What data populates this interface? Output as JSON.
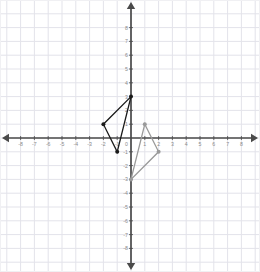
{
  "chart_data": {
    "type": "scatter",
    "title": "",
    "subtitle": "",
    "xlabel": "",
    "ylabel": "",
    "xlim": [
      -8.8,
      8.8
    ],
    "ylim": [
      -8.8,
      8.8
    ],
    "grid": true,
    "grid_step": 1,
    "legend": "none",
    "axis_arrows": true,
    "xticks": [
      -8,
      -7,
      -6,
      -5,
      -4,
      -3,
      -2,
      -1,
      1,
      2,
      3,
      4,
      5,
      6,
      7,
      8
    ],
    "xtick_labels": [
      "-8",
      "-7",
      "-6",
      "-5",
      "-4",
      "-3",
      "-2",
      "-1",
      "1",
      "2",
      "3",
      "4",
      "5",
      "6",
      "7",
      "8"
    ],
    "yticks": [
      8,
      7,
      6,
      5,
      4,
      3,
      2,
      1,
      -1,
      -2,
      -3,
      -4,
      -5,
      -6,
      -7,
      -8
    ],
    "ytick_labels": [
      "8",
      "7",
      "6",
      "5",
      "4",
      "3",
      "2",
      "1",
      "-1",
      "-2",
      "-3",
      "-4",
      "-5",
      "-6",
      "-7",
      "-8"
    ],
    "origin_label": "0",
    "series": [
      {
        "name": "pre-image-triangle",
        "shape": "triangle",
        "color": "#1a1a1a",
        "closed": true,
        "points": [
          {
            "x": 0,
            "y": 3
          },
          {
            "x": -2,
            "y": 1
          },
          {
            "x": -1,
            "y": -1
          }
        ]
      },
      {
        "name": "image-triangle",
        "shape": "triangle",
        "color": "#9a9a9a",
        "closed": true,
        "points": [
          {
            "x": 1,
            "y": 1
          },
          {
            "x": 2,
            "y": -1
          },
          {
            "x": 0,
            "y": -3
          }
        ]
      }
    ]
  },
  "colors": {
    "background": "#ffffff",
    "grid_line": "#e3e3ea",
    "axis_line": "#4a4a4a",
    "tick_label": "#8a8a8a",
    "series_primary": "#1a1a1a",
    "series_secondary": "#9a9a9a",
    "plot_border": "#f0f0f3"
  }
}
